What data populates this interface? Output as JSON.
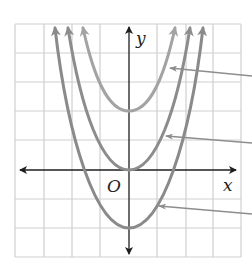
{
  "diagram": {
    "type": "coordinate-graph",
    "axes": {
      "x_label": "x",
      "y_label": "y",
      "origin_label": "O"
    },
    "grid": {
      "columns": 8,
      "rows": 8
    },
    "curves": [
      {
        "name": "parabola-up-2",
        "equation": "y = x^2 + 2",
        "vertex": [
          0,
          2
        ],
        "color": "#a3a3a3"
      },
      {
        "name": "parabola-base",
        "equation": "y = x^2",
        "vertex": [
          0,
          0
        ],
        "color": "#8c8c8c"
      },
      {
        "name": "parabola-down-2",
        "equation": "y = x^2 - 2",
        "vertex": [
          0,
          -2
        ],
        "color": "#8a8a8a"
      }
    ],
    "pointers": 3,
    "colors": {
      "grid": "#cfcfcf",
      "axis": "#1e1e1e",
      "pointer": "#8d8d8d"
    }
  }
}
